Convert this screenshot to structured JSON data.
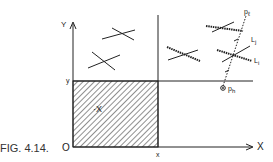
{
  "figure": {
    "caption": "FIG. 4.14.",
    "axes": {
      "x_label": "X",
      "y_label": "Y",
      "origin_label": "O",
      "x_mark": "x",
      "y_mark": "y"
    },
    "region_label": "·X",
    "points": {
      "top_label": "p",
      "top_subscript": "ℓ",
      "bottom_label": "p",
      "bottom_subscript": "h"
    },
    "lines": {
      "upper_label": "L",
      "upper_subscript": "j",
      "lower_label": "L",
      "lower_subscript": "i"
    }
  }
}
